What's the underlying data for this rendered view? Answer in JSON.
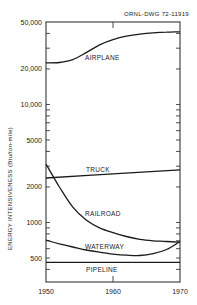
{
  "figure_id": "ORNL-DWG 72-11919",
  "chart_data": {
    "type": "line",
    "title": "",
    "annotation": "ORNL-DWG 72-11919",
    "xlabel": "",
    "ylabel": "ENERGY INTENSIVENESS (Btu/ton-mile)",
    "xlim": [
      1950,
      1970
    ],
    "ylim": [
      313,
      50000
    ],
    "yscale": "log",
    "grid": false,
    "legend": "inline labels",
    "x_ticks": [
      1950,
      1960,
      1970
    ],
    "x_tick_labels": [
      "1950",
      "1960",
      "1970"
    ],
    "y_ticks": [
      500,
      1000,
      2000,
      5000,
      10000,
      20000,
      50000
    ],
    "y_tick_labels": [
      "500",
      "1000",
      "2000",
      "5000",
      "10,000",
      "20,000",
      "50,000"
    ],
    "series": [
      {
        "name": "AIRPLANE",
        "x": [
          1950,
          1952,
          1954,
          1956,
          1958,
          1960,
          1962,
          1964,
          1966,
          1968,
          1970
        ],
        "values": [
          22500,
          22700,
          24000,
          27500,
          32000,
          35500,
          38000,
          39500,
          40500,
          41000,
          41300
        ]
      },
      {
        "name": "TRUCK",
        "x": [
          1950,
          1960,
          1970
        ],
        "values": [
          2380,
          2580,
          2790
        ]
      },
      {
        "name": "RAILROAD",
        "x": [
          1950,
          1952,
          1954,
          1956,
          1958,
          1960,
          1962,
          1964,
          1966,
          1968,
          1970
        ],
        "values": [
          3130,
          2000,
          1350,
          1050,
          900,
          820,
          760,
          720,
          700,
          690,
          680
        ]
      },
      {
        "name": "WATERWAY",
        "x": [
          1950,
          1952,
          1954,
          1956,
          1958,
          1960,
          1962,
          1964,
          1966,
          1968,
          1970
        ],
        "values": [
          710,
          660,
          620,
          585,
          560,
          540,
          528,
          525,
          545,
          590,
          690
        ]
      },
      {
        "name": "PIPELINE",
        "x": [
          1950,
          1960,
          1970
        ],
        "values": [
          460,
          460,
          460
        ]
      }
    ]
  },
  "labels": {
    "airplane": "AIRPLANE",
    "truck": "TRUCK",
    "railroad": "RAILROAD",
    "waterway": "WATERWAY",
    "pipeline": "PIPELINE"
  }
}
